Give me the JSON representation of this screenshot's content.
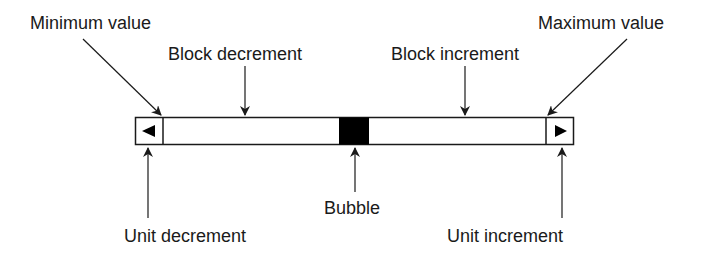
{
  "diagram": {
    "type": "annotated-scrollbar",
    "colors": {
      "stroke": "#1a1a1a",
      "background": "#ffffff",
      "bubble": "#000000"
    },
    "scrollbar": {
      "left_button_icon": "left-triangle-icon",
      "right_button_icon": "right-triangle-icon",
      "bubble_position_fraction": 0.46
    },
    "labels": {
      "minimum_value": "Minimum value",
      "block_decrement": "Block decrement",
      "block_increment": "Block increment",
      "maximum_value": "Maximum value",
      "unit_decrement": "Unit decrement",
      "bubble": "Bubble",
      "unit_increment": "Unit increment"
    }
  }
}
